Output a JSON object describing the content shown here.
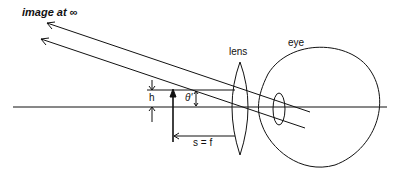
{
  "diagram": {
    "title_label": "image at ∞",
    "lens_label": "lens",
    "eye_label": "eye",
    "height_label": "h",
    "angle_label": "θ'",
    "distance_label": "s = f",
    "elements": [
      "optical axis",
      "object arrow of height h",
      "converging lens",
      "eye",
      "parallel rays to image at infinity"
    ]
  }
}
